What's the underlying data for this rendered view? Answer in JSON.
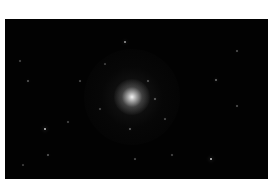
{
  "image": {
    "subject": "globular star cluster",
    "background_color": "#020202",
    "margin_color": "#ffffff",
    "stars": [
      {
        "x": 120,
        "y": 23,
        "r": 1.2,
        "b": 0.7
      },
      {
        "x": 40,
        "y": 110,
        "r": 1.4,
        "b": 0.9
      },
      {
        "x": 206,
        "y": 140,
        "r": 1.4,
        "b": 0.9
      },
      {
        "x": 211,
        "y": 61,
        "r": 1.0,
        "b": 0.5
      },
      {
        "x": 23,
        "y": 62,
        "r": 0.9,
        "b": 0.4
      },
      {
        "x": 232,
        "y": 32,
        "r": 0.8,
        "b": 0.35
      },
      {
        "x": 232,
        "y": 87,
        "r": 0.8,
        "b": 0.35
      },
      {
        "x": 43,
        "y": 136,
        "r": 0.9,
        "b": 0.4
      },
      {
        "x": 125,
        "y": 110,
        "r": 0.9,
        "b": 0.45
      },
      {
        "x": 15,
        "y": 42,
        "r": 0.7,
        "b": 0.3
      },
      {
        "x": 63,
        "y": 103,
        "r": 0.7,
        "b": 0.3
      },
      {
        "x": 167,
        "y": 136,
        "r": 0.7,
        "b": 0.3
      },
      {
        "x": 150,
        "y": 80,
        "r": 0.8,
        "b": 0.4
      },
      {
        "x": 143,
        "y": 62,
        "r": 0.7,
        "b": 0.35
      },
      {
        "x": 95,
        "y": 90,
        "r": 0.7,
        "b": 0.3
      },
      {
        "x": 75,
        "y": 62,
        "r": 0.6,
        "b": 0.3
      },
      {
        "x": 160,
        "y": 100,
        "r": 0.6,
        "b": 0.3
      },
      {
        "x": 130,
        "y": 140,
        "r": 0.6,
        "b": 0.3
      },
      {
        "x": 18,
        "y": 146,
        "r": 0.6,
        "b": 0.25
      },
      {
        "x": 100,
        "y": 45,
        "r": 0.6,
        "b": 0.25
      }
    ]
  }
}
